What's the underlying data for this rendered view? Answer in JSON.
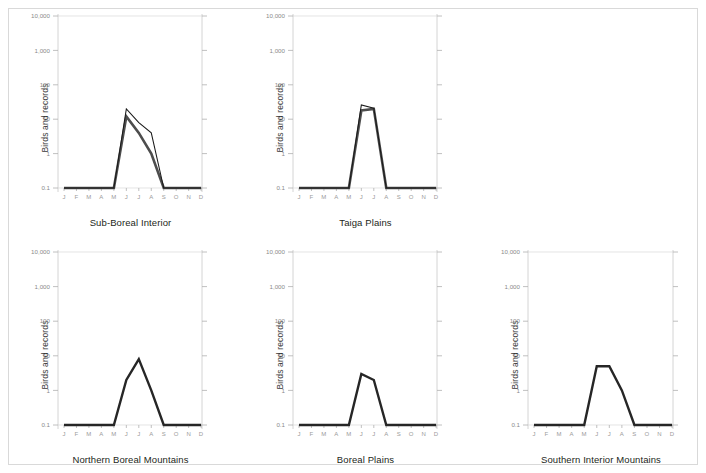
{
  "page": {
    "background_color": "#ffffff",
    "frame_color": "#d9d9d9",
    "y_axis_label": "Birds and records"
  },
  "axis": {
    "y_ticks": [
      "10,000",
      "1,000",
      "100",
      "10",
      "1",
      "0.1"
    ],
    "y_tick_values": [
      10000,
      1000,
      100,
      10,
      1,
      0.1
    ],
    "x_ticks": [
      "J",
      "F",
      "M",
      "A",
      "M",
      "J",
      "J",
      "A",
      "S",
      "O",
      "N",
      "D"
    ],
    "months_full": [
      "January",
      "February",
      "March",
      "April",
      "May",
      "June",
      "July",
      "August",
      "September",
      "October",
      "November",
      "December"
    ]
  },
  "colors": {
    "series_birds": "#1a1a1a",
    "series_records": "#4d4d4d",
    "series_single": "#262626",
    "gridline": "#d8d8d8",
    "axis": "#c9c9c9",
    "tick_label": "#8a8a8a",
    "title_text": "#231f20"
  },
  "chart_data": [
    {
      "type": "line",
      "title": "Sub-Boreal Interior",
      "xlabel": "",
      "ylabel": "Birds and records",
      "ylim": [
        0.1,
        10000
      ],
      "yscale": "log",
      "grid": true,
      "legend": "none",
      "categories": [
        "J",
        "F",
        "M",
        "A",
        "M",
        "J",
        "J",
        "A",
        "S",
        "O",
        "N",
        "D"
      ],
      "series": [
        {
          "name": "Birds",
          "values": [
            0.1,
            0.1,
            0.1,
            0.1,
            0.1,
            20,
            8,
            4,
            0.1,
            0.1,
            0.1,
            0.1
          ]
        },
        {
          "name": "Records",
          "values": [
            0.1,
            0.1,
            0.1,
            0.1,
            0.1,
            12,
            4,
            1,
            0.1,
            0.1,
            0.1,
            0.1
          ]
        }
      ]
    },
    {
      "type": "line",
      "title": "Taiga Plains",
      "xlabel": "",
      "ylabel": "Birds and records",
      "ylim": [
        0.1,
        10000
      ],
      "yscale": "log",
      "grid": true,
      "legend": "none",
      "categories": [
        "J",
        "F",
        "M",
        "A",
        "M",
        "J",
        "J",
        "A",
        "S",
        "O",
        "N",
        "D"
      ],
      "series": [
        {
          "name": "Birds",
          "values": [
            0.1,
            0.1,
            0.1,
            0.1,
            0.1,
            26,
            21,
            0.1,
            0.1,
            0.1,
            0.1,
            0.1
          ]
        },
        {
          "name": "Records",
          "values": [
            0.1,
            0.1,
            0.1,
            0.1,
            0.1,
            18,
            20,
            0.1,
            0.1,
            0.1,
            0.1,
            0.1
          ]
        }
      ]
    },
    {
      "type": "line",
      "title": "Northern Boreal Mountains",
      "xlabel": "",
      "ylabel": "Birds and records",
      "ylim": [
        0.1,
        10000
      ],
      "yscale": "log",
      "grid": true,
      "legend": "none",
      "categories": [
        "J",
        "F",
        "M",
        "A",
        "M",
        "J",
        "J",
        "A",
        "S",
        "O",
        "N",
        "D"
      ],
      "series": [
        {
          "name": "Birds and records",
          "values": [
            0.1,
            0.1,
            0.1,
            0.1,
            0.1,
            2,
            8,
            1,
            0.1,
            0.1,
            0.1,
            0.1
          ]
        }
      ]
    },
    {
      "type": "line",
      "title": "Boreal Plains",
      "xlabel": "",
      "ylabel": "Birds and records",
      "ylim": [
        0.1,
        10000
      ],
      "yscale": "log",
      "grid": true,
      "legend": "none",
      "categories": [
        "J",
        "F",
        "M",
        "A",
        "M",
        "J",
        "J",
        "A",
        "S",
        "O",
        "N",
        "D"
      ],
      "series": [
        {
          "name": "Birds and records",
          "values": [
            0.1,
            0.1,
            0.1,
            0.1,
            0.1,
            3,
            2,
            0.1,
            0.1,
            0.1,
            0.1,
            0.1
          ]
        }
      ]
    },
    {
      "type": "line",
      "title": "Southern Interior Mountains",
      "xlabel": "",
      "ylabel": "Birds and records",
      "ylim": [
        0.1,
        10000
      ],
      "yscale": "log",
      "grid": true,
      "legend": "none",
      "categories": [
        "J",
        "F",
        "M",
        "A",
        "M",
        "J",
        "J",
        "A",
        "S",
        "O",
        "N",
        "D"
      ],
      "series": [
        {
          "name": "Birds and records",
          "values": [
            0.1,
            0.1,
            0.1,
            0.1,
            0.1,
            5,
            5,
            1,
            0.1,
            0.1,
            0.1,
            0.1
          ]
        }
      ]
    }
  ]
}
